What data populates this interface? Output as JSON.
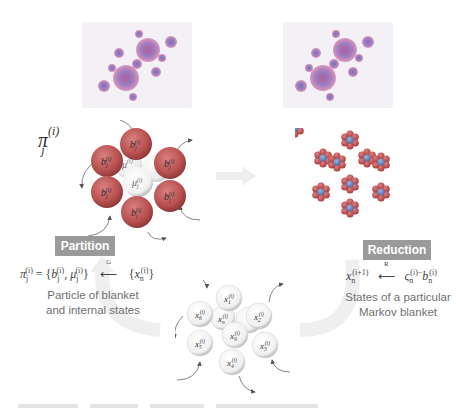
{
  "diagram": {
    "type": "cycle-process",
    "panels": {
      "top_left_fractal": {
        "description": "Julia-set fractal image",
        "colors": [
          "#7a6fb8",
          "#c8609a",
          "#e5dff0"
        ]
      },
      "top_right_fractal": {
        "description": "Julia-set fractal image",
        "colors": [
          "#7a6fb8",
          "#c8609a",
          "#e5dff0"
        ]
      }
    },
    "left_cluster": {
      "pi_label": {
        "base": "π",
        "sub": "j",
        "sup": "(i)"
      },
      "blanket_nodes": [
        {
          "label": "b",
          "sub": "j",
          "sup": "(i)"
        },
        {
          "label": "b",
          "sub": "j",
          "sup": "(i)"
        },
        {
          "label": "b",
          "sub": "j",
          "sup": "(i)"
        },
        {
          "label": "b",
          "sub": "j",
          "sup": "(i)"
        },
        {
          "label": "b",
          "sub": "j",
          "sup": "(i)"
        },
        {
          "label": "b",
          "sub": "j",
          "sup": "(i)"
        }
      ],
      "internal_nodes": [
        {
          "label": "μ",
          "sub": "j",
          "sup": "(i)"
        },
        {
          "label": "μ",
          "sub": "j",
          "sup": "(i)"
        },
        {
          "label": "μ",
          "sub": "j",
          "sup": "(i)"
        }
      ],
      "blanket_color": "#b8504f",
      "internal_color": "#f4f4f4"
    },
    "bottom_cluster": {
      "nodes": [
        {
          "label": "x",
          "sub": "1",
          "sup": "(i)"
        },
        {
          "label": "x",
          "sub": "6",
          "sup": "(i)"
        },
        {
          "label": "x",
          "sub": "2",
          "sup": "(i)"
        },
        {
          "label": "x",
          "sub": "n",
          "sup": "(i)"
        },
        {
          "label": "x",
          "sub": "5",
          "sup": "(i)"
        },
        {
          "label": "x",
          "sub": "9",
          "sup": "(i)"
        },
        {
          "label": "x",
          "sub": "3",
          "sup": "(i)"
        },
        {
          "label": "x",
          "sub": "4",
          "sup": "(i)"
        },
        {
          "label": "x",
          "sub": "7",
          "sup": "(i)"
        }
      ],
      "node_color": "#f2f2f2"
    },
    "right_cluster": {
      "description": "hexagonal cluster of small particle ensembles",
      "colors": [
        "#c24a4a",
        "#5a7fbf"
      ]
    },
    "labels": {
      "partition": "Partition",
      "reduction": "Reduction"
    },
    "formulas": {
      "partition_lhs_base": "π",
      "partition_lhs_sub": "j",
      "partition_lhs_sup": "(i)",
      "partition_eq": " = {",
      "partition_b": "b",
      "partition_b_sub": "j",
      "partition_b_sup": "(i)",
      "partition_comma": ", ",
      "partition_mu": "μ",
      "partition_mu_sub": "j",
      "partition_mu_sup": "(i)",
      "partition_close": "}",
      "partition_operator": "G",
      "partition_rhs_open": "{",
      "partition_rhs_x": "x",
      "partition_rhs_sub": "n",
      "partition_rhs_sup": "(i)",
      "partition_rhs_close": "}",
      "reduction_lhs": "x",
      "reduction_lhs_sub": "n",
      "reduction_lhs_sup": "(i+1)",
      "reduction_operator": "R",
      "reduction_rhs": "ς",
      "reduction_rhs_sub": "n",
      "reduction_rhs_sup": "(i)",
      "reduction_rhs_b": "b",
      "reduction_rhs_b_sub": "n",
      "reduction_rhs_b_sup": "(i)",
      "reduction_minus": "−"
    },
    "captions": {
      "partition_line1": "Particle of blanket",
      "partition_line2": "and internal states",
      "reduction_line1": "States of a particular",
      "reduction_line2": "Markov blanket"
    },
    "accent_colors": {
      "label_bg": "#9a9a9a",
      "cycle_arrow": "#ededed",
      "arrow_stroke": "#555555"
    }
  }
}
